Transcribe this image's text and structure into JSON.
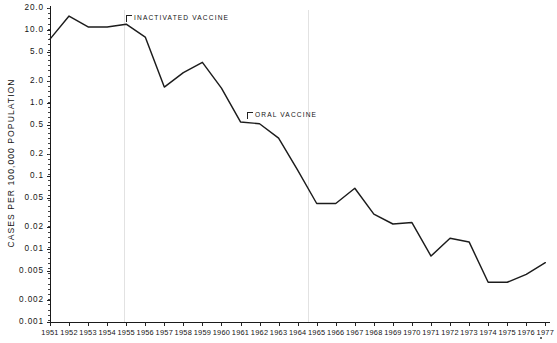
{
  "chart_data": {
    "type": "line",
    "title": "",
    "xlabel": "",
    "ylabel": "CASES PER 100,000 POPULATION",
    "yscale": "log",
    "ylim": [
      0.001,
      20.0
    ],
    "ytick_values": [
      20.0,
      10.0,
      5.0,
      2.0,
      1.0,
      0.5,
      0.2,
      0.1,
      0.05,
      0.02,
      0.01,
      0.005,
      0.002,
      0.001
    ],
    "ytick_labels": [
      "20.0",
      "10.0",
      "5.0",
      "2.0",
      "1.0",
      "0.5",
      "0.2",
      "0.1",
      "0.05",
      "0.02",
      "0.01",
      "0.005",
      "0.002",
      "0.001"
    ],
    "grid": false,
    "legend": "none",
    "categories": [
      "1951",
      "1952",
      "1953",
      "1954",
      "1955",
      "1956",
      "1957",
      "1958",
      "1959",
      "1960",
      "1961",
      "1962",
      "1963",
      "1964",
      "1965",
      "1966",
      "1967",
      "1968",
      "1969",
      "1970",
      "1971",
      "1972",
      "1973",
      "1974",
      "1975",
      "1976",
      "1977"
    ],
    "x": [
      1951,
      1952,
      1953,
      1954,
      1955,
      1956,
      1957,
      1958,
      1959,
      1960,
      1961,
      1962,
      1963,
      1964,
      1965,
      1966,
      1967,
      1968,
      1969,
      1970,
      1971,
      1972,
      1973,
      1974,
      1975,
      1976,
      1977
    ],
    "values": [
      7.5,
      15.5,
      11.0,
      11.0,
      12.0,
      8.0,
      1.65,
      2.6,
      3.6,
      1.6,
      0.55,
      0.52,
      0.33,
      0.12,
      0.042,
      0.042,
      0.068,
      0.03,
      0.022,
      0.023,
      0.008,
      0.014,
      0.0125,
      0.0035,
      0.0035,
      0.0045,
      0.0065
    ],
    "annotations": [
      {
        "label": "INACTIVATED VACCINE",
        "year": 1955,
        "x_px": 126,
        "y_px": 14
      },
      {
        "label": "ORAL VACCINE",
        "year": 1962,
        "x_px": 247,
        "y_px": 111
      }
    ],
    "reference_lines": [
      {
        "year": 1955,
        "x_px": 124
      },
      {
        "year": 1964,
        "x_px": 308
      }
    ]
  },
  "axes": {
    "y_axis_title": "CASES PER 100,000 POPULATION",
    "y_ticks": [
      {
        "label": "20.0",
        "value": 20.0,
        "y_px": 8
      },
      {
        "label": "10.0",
        "value": 10.0,
        "y_px": 30
      },
      {
        "label": "5.0",
        "value": 5.0,
        "y_px": 50
      },
      {
        "label": "2.0",
        "value": 2.0,
        "y_px": 76
      },
      {
        "label": "1.0",
        "value": 1.0,
        "y_px": 96
      },
      {
        "label": "0.5",
        "value": 0.5,
        "y_px": 118
      },
      {
        "label": "0.2",
        "value": 0.2,
        "y_px": 145
      },
      {
        "label": "0.1",
        "value": 0.1,
        "y_px": 168
      },
      {
        "label": "0.05",
        "value": 0.05,
        "y_px": 194
      },
      {
        "label": "0.02",
        "value": 0.02,
        "y_px": 222
      },
      {
        "label": "0.01",
        "value": 0.01,
        "y_px": 244
      },
      {
        "label": "0.005",
        "value": 0.005,
        "y_px": 272
      },
      {
        "label": "0.002",
        "value": 0.002,
        "y_px": 300
      },
      {
        "label": "0.001",
        "value": 0.001,
        "y_px": 322
      }
    ],
    "x_ticks": [
      "1951",
      "1952",
      "1953",
      "1954",
      "1955",
      "1956",
      "1957",
      "1958",
      "1959",
      "1960",
      "1961",
      "1962",
      "1963",
      "1964",
      "1965",
      "1966",
      "1967",
      "1968",
      "1969",
      "1970",
      "1971",
      "1972",
      "1973",
      "1974",
      "1975",
      "1976",
      "1977"
    ]
  }
}
